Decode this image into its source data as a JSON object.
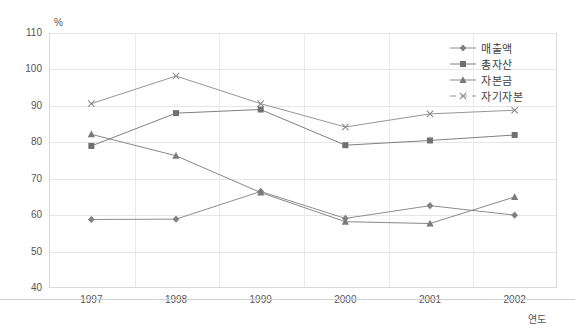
{
  "chart_data": {
    "type": "line",
    "title": "",
    "xlabel": "연도",
    "ylabel": "%",
    "categories": [
      "1997",
      "1998",
      "1999",
      "2000",
      "2001",
      "2002"
    ],
    "ylim": [
      40,
      110
    ],
    "yticks": [
      40,
      50,
      60,
      70,
      80,
      90,
      100,
      110
    ],
    "grid": true,
    "legend_position": "top-right",
    "series": [
      {
        "name": "매출액",
        "marker": "diamond",
        "color": "#808080",
        "values": [
          58.8,
          58.9,
          66.5,
          59.1,
          62.6,
          60.0
        ]
      },
      {
        "name": "총자산",
        "marker": "square",
        "color": "#707070",
        "values": [
          79.0,
          88.0,
          89.0,
          79.2,
          80.5,
          82.0
        ]
      },
      {
        "name": "자본금",
        "marker": "triangle",
        "color": "#7a7a7a",
        "values": [
          82.2,
          76.3,
          66.2,
          58.2,
          57.7,
          65.0
        ]
      },
      {
        "name": "자기자본",
        "marker": "cross",
        "color": "#8a8a8a",
        "values": [
          90.6,
          98.2,
          90.6,
          84.2,
          87.8,
          88.8
        ]
      }
    ]
  },
  "axis": {
    "unit_label": "%",
    "x_axis_title": "연도"
  }
}
